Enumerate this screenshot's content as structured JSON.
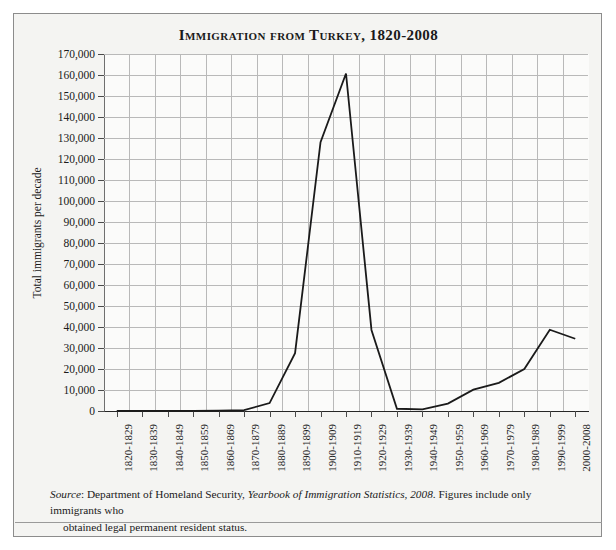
{
  "figure": {
    "title": "Immigration from Turkey, 1820-2008",
    "background_color": "#f4f4f2",
    "plot_background_color": "#fbfbfa",
    "border_color": "#8c8c8c",
    "line_color": "#1a1a1a",
    "grid_color": "#b9b9b9"
  },
  "source_note": {
    "label": "Source",
    "text_before_italic": ": Department of Homeland Security, ",
    "italic_title": "Yearbook of Immigration Statistics, 2008",
    "text_after_italic": ". Figures include only immigrants who",
    "line2": "obtained legal permanent resident status."
  },
  "chart_data": {
    "type": "line",
    "title": "Immigration from Turkey, 1820-2008",
    "xlabel": "",
    "ylabel": "Total immigrants per decade",
    "ylim": [
      0,
      170000
    ],
    "ytick_step": 10000,
    "grid": true,
    "legend": "none",
    "categories": [
      "1820-1829",
      "1830-1839",
      "1840-1849",
      "1850-1859",
      "1860-1869",
      "1870-1879",
      "1880-1889",
      "1890-1899",
      "1900-1909",
      "1910-1919",
      "1920-1929",
      "1930-1939",
      "1940-1949",
      "1950-1959",
      "1960-1969",
      "1970-1979",
      "1980-1989",
      "1990-1999",
      "2000-2008"
    ],
    "values": [
      20,
      20,
      59,
      83,
      131,
      404,
      3782,
      27510,
      127999,
      160717,
      38600,
      1065,
      798,
      3519,
      10142,
      13399,
      20000,
      38687,
      34400
    ],
    "ytick_labels": [
      "170,000",
      "160,000",
      "150,000",
      "140,000",
      "130,000",
      "120,000",
      "110,000",
      "100,000",
      "90,000",
      "80,000",
      "70,000",
      "60,000",
      "50,000",
      "40,000",
      "30,000",
      "20,000",
      "10,000",
      "0"
    ]
  }
}
